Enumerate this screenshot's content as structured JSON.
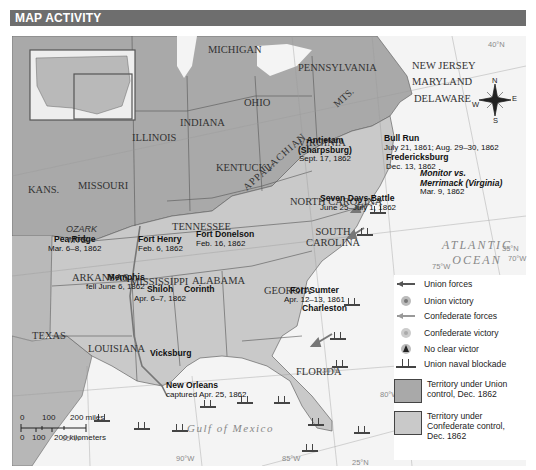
{
  "header": {
    "title": "MAP ACTIVITY"
  },
  "states": [
    {
      "name": "MICHIGAN",
      "x": 208,
      "y": 44
    },
    {
      "name": "PENNSYLVANIA",
      "x": 296,
      "y": 62
    },
    {
      "name": "NEW JERSEY",
      "x": 412,
      "y": 62
    },
    {
      "name": "MARYLAND",
      "x": 412,
      "y": 78
    },
    {
      "name": "DELAWARE",
      "x": 414,
      "y": 95
    },
    {
      "name": "OHIO",
      "x": 244,
      "y": 97
    },
    {
      "name": "INDIANA",
      "x": 180,
      "y": 117
    },
    {
      "name": "ILLINOIS",
      "x": 132,
      "y": 132
    },
    {
      "name": "VIRGINIA",
      "x": 298,
      "y": 137
    },
    {
      "name": "KENTUCKY",
      "x": 216,
      "y": 162
    },
    {
      "name": "KANS.",
      "x": 28,
      "y": 184
    },
    {
      "name": "MISSOURI",
      "x": 78,
      "y": 180
    },
    {
      "name": "NORTH CAROLINA",
      "x": 290,
      "y": 196
    },
    {
      "name": "TENNESSEE",
      "x": 172,
      "y": 221
    },
    {
      "name": "SOUTH CAROLINA",
      "x": 296,
      "y": 232
    },
    {
      "name": "ARKANSAS",
      "x": 72,
      "y": 272
    },
    {
      "name": "MISSISSIPPI",
      "x": 128,
      "y": 276
    },
    {
      "name": "ALABAMA",
      "x": 190,
      "y": 275
    },
    {
      "name": "GEORGIA",
      "x": 262,
      "y": 285
    },
    {
      "name": "TEXAS",
      "x": 22,
      "y": 330
    },
    {
      "name": "LOUISIANA",
      "x": 76,
      "y": 343
    },
    {
      "name": "FLORIDA",
      "x": 295,
      "y": 366
    }
  ],
  "regions": {
    "appalachian": "APPALACHIAN",
    "mts": "MTS.",
    "ozark": "OZARK",
    "ozark_mts": "MTS."
  },
  "rivers": {
    "missouri": "Missouri R.",
    "ohio": "Ohio R.",
    "cumberland": "Cumberland R.",
    "mississippi": "Mississippi R."
  },
  "battles": [
    {
      "id": "antietam",
      "name": "Antietam",
      "name2": "(Sharpsburg)",
      "date": "Sept. 17, 1862",
      "x": 296,
      "y": 103,
      "type": "union"
    },
    {
      "id": "bull-run",
      "name": "Bull Run",
      "date": "July 21, 1861; Aug. 29–30, 1862",
      "x": 373,
      "y": 104,
      "type": "confederate"
    },
    {
      "id": "fredericksburg",
      "name": "Fredericksburg",
      "date": "Dec. 13, 1862",
      "x": 373,
      "y": 121,
      "type": "confederate"
    },
    {
      "id": "monitor",
      "name": "Monitor vs.",
      "name2": "Merrimack (Virginia)",
      "date": "Mar. 9, 1862",
      "x": 409,
      "y": 137,
      "type": "none"
    },
    {
      "id": "seven-days",
      "name": "Seven Days Battle",
      "date": "June 25–July 1, 1862",
      "x": 320,
      "y": 162,
      "type": "confederate"
    },
    {
      "id": "fort-henry",
      "name": "Fort Henry",
      "date": "Feb. 6, 1862",
      "x": 137,
      "y": 203,
      "type": "union"
    },
    {
      "id": "fort-donelson",
      "name": "Fort Donelson",
      "date": "Feb. 16, 1862",
      "x": 184,
      "y": 198,
      "type": "union"
    },
    {
      "id": "pea-ridge",
      "name": "Pea Ridge",
      "date": "Mar. 6–8, 1862",
      "x": 46,
      "y": 203,
      "type": "union"
    },
    {
      "id": "memphis",
      "name": "Memphis",
      "date": "fell June 6, 1862",
      "x": 85,
      "y": 241,
      "type": "city"
    },
    {
      "id": "shiloh",
      "name": "Shiloh",
      "date": "Apr. 6–7, 1862",
      "x": 135,
      "y": 253,
      "type": "union"
    },
    {
      "id": "corinth",
      "name": "Corinth",
      "date": "",
      "x": 182,
      "y": 253,
      "type": "city"
    },
    {
      "id": "fort-sumter",
      "name": "Fort Sumter",
      "date": "Apr. 12–13, 1861",
      "x": 283,
      "y": 254,
      "type": "confederate"
    },
    {
      "id": "charleston",
      "name": "Charleston",
      "date": "",
      "x": 300,
      "y": 272,
      "type": "city"
    },
    {
      "id": "vicksburg",
      "name": "Vicksburg",
      "date": "",
      "x": 141,
      "y": 315,
      "type": "city"
    },
    {
      "id": "new-orleans",
      "name": "New Orleans",
      "date": "captured Apr. 25, 1862",
      "x": 165,
      "y": 349,
      "type": "city"
    }
  ],
  "oceans": {
    "atlantic": "ATLANTIC",
    "atlantic2": "OCEAN",
    "gulf": "Gulf of Mexico"
  },
  "gridlines": {
    "lat40": "40°N",
    "lat35": "35°N",
    "lat30": "30°N",
    "lat25": "25°N",
    "lon70": "70°W",
    "lon75": "75°W",
    "lon80": "80°W",
    "lon85": "85°W",
    "lon90": "90°W",
    "lon95": "95°W"
  },
  "compass": {
    "n": "N",
    "e": "E",
    "s": "S",
    "w": "W"
  },
  "legend": {
    "items": [
      {
        "label": "Union forces",
        "icon": "union-arrow-icon"
      },
      {
        "label": "Union victory",
        "icon": "union-victory-icon"
      },
      {
        "label": "Confederate forces",
        "icon": "confederate-arrow-icon"
      },
      {
        "label": "Confederate victory",
        "icon": "confederate-victory-icon"
      },
      {
        "label": "No clear victor",
        "icon": "no-victor-icon"
      },
      {
        "label": "Union naval blockade",
        "icon": "ship-icon"
      }
    ],
    "union_territory": "Territory under Union control, Dec. 1862",
    "confederate_territory": "Territory under Confederate control, Dec. 1862"
  },
  "scale": {
    "miles": [
      "0",
      "100",
      "200 miles"
    ],
    "km": [
      "0",
      "100",
      "200 kilometers"
    ]
  },
  "colors": {
    "header": "#6e6e6e",
    "union": "#a9a9a9",
    "confederate": "#c9c9c9",
    "water": "#f4f4f4",
    "west": "#b7b7b7"
  }
}
